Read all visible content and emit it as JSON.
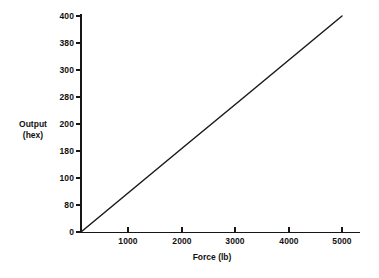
{
  "chart_data": {
    "type": "line",
    "title": "",
    "subtitle": "",
    "xlabel": "Force (lb)",
    "ylabel": "Output (hex)",
    "ylabel_lines": [
      "Output",
      "(hex)"
    ],
    "grid": false,
    "legend": null,
    "x_tick_labels": [
      "1000",
      "2000",
      "3000",
      "4000",
      "5000"
    ],
    "x_tick_values": [
      1000,
      2000,
      3000,
      4000,
      5000
    ],
    "y_tick_labels": [
      "0",
      "80",
      "100",
      "180",
      "200",
      "280",
      "300",
      "380",
      "400"
    ],
    "y_tick_values_hex": [
      "0",
      "80",
      "100",
      "180",
      "200",
      "280",
      "300",
      "380",
      "400"
    ],
    "y_tick_values_dec": [
      0,
      128,
      256,
      384,
      512,
      640,
      768,
      896,
      1024
    ],
    "xlim": [
      0,
      5400
    ],
    "ylim_dec": [
      0,
      1024
    ],
    "ylim_hex": [
      "0",
      "400"
    ],
    "series": [
      {
        "name": "output",
        "x": [
          0,
          1000,
          2000,
          3000,
          4000,
          5000
        ],
        "y_hex": [
          "0",
          "CD",
          "19A",
          "266",
          "333",
          "400"
        ],
        "y_dec": [
          0,
          205,
          410,
          614,
          819,
          1024
        ],
        "color": "#1a1a1a",
        "style": "solid"
      }
    ],
    "annotations": [],
    "axis_color": "#161616",
    "background_color": "#ffffff"
  },
  "geometry": {
    "plot_left": 81,
    "plot_right": 360,
    "plot_top": 16,
    "plot_bottom": 232,
    "x_axis_end": 360,
    "y_axis_top": 14,
    "x_pixels_per_unit": 0.0539,
    "y_tick_spacing_px": 27
  },
  "labels": {
    "y_axis_title_line1": "Output",
    "y_axis_title_line2": "(hex)",
    "x_axis_title": "Force (lb)"
  }
}
